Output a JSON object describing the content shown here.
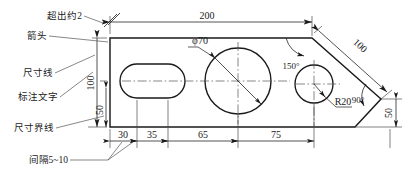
{
  "figure": {
    "kind": "engineering-drawing",
    "background": "#ffffff",
    "line_color": "#1a1a1a",
    "thin_line_color": "#4a4a4a",
    "center_line_color": "#555555"
  },
  "annotations": {
    "overshoot": "超出约2",
    "arrowhead": "箭头",
    "dimension_line": "尺寸线",
    "dimension_text": "标注文字",
    "extension_line": "尺寸界线",
    "spacing": "间隔5~10"
  },
  "dimensions": {
    "overall_length": "200",
    "height_outer": "100",
    "height_inner": "50",
    "chain": [
      "30",
      "35",
      "65",
      "75"
    ],
    "slant_length": "100",
    "right_height": "50",
    "angle_obtuse": "150°",
    "angle_right": "90°",
    "circle_big": "φ70",
    "radius_small": "R20"
  }
}
